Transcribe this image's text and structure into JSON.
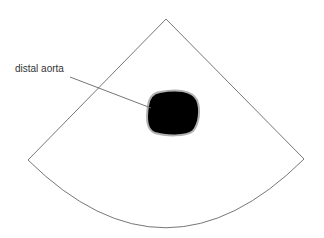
{
  "diagram": {
    "type": "ultrasound-sector-schematic",
    "sector": {
      "apex": [
        166,
        19
      ],
      "left_corner": [
        28,
        160
      ],
      "right_corner": [
        304,
        159
      ],
      "arc_bottom": [
        166,
        226
      ],
      "stroke": "#777777"
    },
    "structure": {
      "name": "distal aorta",
      "fill": "#000000",
      "outline": "#aaaaaa",
      "bbox": [
        147,
        91,
        199,
        135
      ]
    },
    "annotations": [
      {
        "text": "distal aorta",
        "position": [
          16,
          63
        ],
        "leader_from": [
          70,
          77
        ],
        "leader_to": [
          151,
          108
        ]
      }
    ]
  }
}
